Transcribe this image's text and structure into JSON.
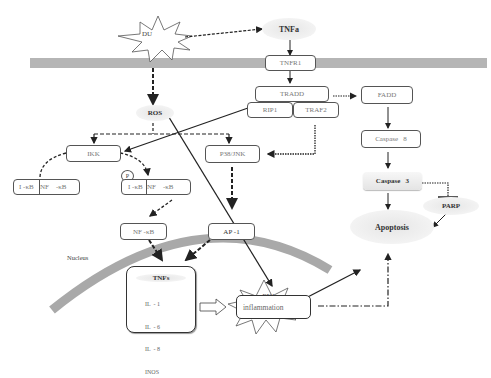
{
  "diagram": {
    "colors": {
      "membrane": "#b5b5b5",
      "nucleus_arc": "#a9a9a9",
      "arrow": "#222222",
      "box_border": "#555555",
      "ellipse_fill": "#e8e8e8"
    },
    "nodes": {
      "du": {
        "label": "DU",
        "shape": "starburst"
      },
      "tnfa_top": {
        "label": "TNFa",
        "shape": "ellipse"
      },
      "tnfr1": {
        "label": "TNFR1",
        "shape": "box"
      },
      "tradd": {
        "label": "TRADD",
        "shape": "box"
      },
      "rip1": {
        "label": "RIP1",
        "shape": "box"
      },
      "traf2": {
        "label": "TRAF2",
        "shape": "box"
      },
      "fadd": {
        "label": "FADD",
        "shape": "box"
      },
      "ros": {
        "label": "ROS",
        "shape": "ellipse"
      },
      "ikk": {
        "label": "IKK",
        "shape": "box"
      },
      "p38jnk": {
        "label": "P38/JNK",
        "shape": "box"
      },
      "caspase8": {
        "label": "Caspase   8",
        "shape": "box"
      },
      "caspase3": {
        "label": "Caspase   3",
        "shape": "box"
      },
      "parp": {
        "label": "PARP",
        "shape": "ellipse"
      },
      "apoptosis": {
        "label": "Apoptosis",
        "shape": "ellipse"
      },
      "ikb_nfkb_left": {
        "left": "I -κB",
        "right": "NF    -κB",
        "shape": "split-box"
      },
      "p_badge": {
        "label": "P",
        "shape": "circle"
      },
      "ikb_nfkb_right": {
        "left": "I -κB",
        "right": "NF    -κB",
        "shape": "split-box"
      },
      "nfkb": {
        "label": "NF -κB",
        "shape": "box"
      },
      "ap1": {
        "label": "AP -1",
        "shape": "box"
      },
      "dna_damage": {
        "line1": "DNA",
        "line2": "damage",
        "shape": "starburst"
      },
      "nucleus": {
        "label": "Nucleus"
      },
      "cytokines": {
        "title": "TNFs",
        "items": [
          "IL  - 1",
          "IL  - 6",
          "IL  - 8",
          "INOS"
        ],
        "shape": "box"
      },
      "inflammation": {
        "label": "inflammation",
        "shape": "box"
      }
    },
    "edges": [
      {
        "from": "DU",
        "to": "TNFa",
        "style": "dashed"
      },
      {
        "from": "TNFa",
        "to": "TNFR1",
        "style": "solid"
      },
      {
        "from": "TNFR1",
        "to": "TRADD",
        "style": "solid"
      },
      {
        "from": "TRADD",
        "to": "FADD",
        "style": "dotted"
      },
      {
        "from": "FADD",
        "to": "Caspase 8",
        "style": "solid"
      },
      {
        "from": "Caspase 8",
        "to": "Caspase 3",
        "style": "solid"
      },
      {
        "from": "Caspase 3",
        "to": "Apoptosis",
        "style": "solid"
      },
      {
        "from": "Caspase 3",
        "to": "PARP",
        "style": "dotted-inhibit"
      },
      {
        "from": "PARP",
        "to": "Apoptosis",
        "style": "solid"
      },
      {
        "from": "DU",
        "to": "ROS",
        "style": "dashed-bold"
      },
      {
        "from": "ROS",
        "to": "IKK",
        "style": "dashed"
      },
      {
        "from": "ROS",
        "to": "P38/JNK",
        "style": "dashed"
      },
      {
        "from": "ROS",
        "to": "DNA damage",
        "style": "solid"
      },
      {
        "from": "RIP1",
        "to": "IKK",
        "style": "solid"
      },
      {
        "from": "TRAF2",
        "to": "P38/JNK",
        "style": "dotted"
      },
      {
        "from": "IKK",
        "to": "I-κB/NF-κB (left)",
        "style": "dashed-curve"
      },
      {
        "from": "IKK",
        "to": "I-κB/NF-κB (P)",
        "style": "dashed-curve"
      },
      {
        "from": "I-κB/NF-κB (P)",
        "to": "NF-κB",
        "style": "dashed"
      },
      {
        "from": "P38/JNK",
        "to": "AP-1",
        "style": "dashed-bold"
      },
      {
        "from": "NF-κB",
        "to": "TNFs",
        "style": "dashed-bold"
      },
      {
        "from": "AP-1",
        "to": "TNFs",
        "style": "dashed-bold"
      },
      {
        "from": "DNA damage",
        "to": "Apoptosis",
        "style": "solid"
      },
      {
        "from": "TNFs",
        "to": "inflammation",
        "style": "hollow-arrow"
      },
      {
        "from": "inflammation",
        "to": "Apoptosis",
        "style": "dash-dot"
      }
    ]
  }
}
